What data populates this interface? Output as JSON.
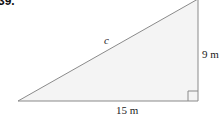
{
  "problem": {
    "number": "39."
  },
  "triangle": {
    "hypotenuse_label": "c",
    "vertical_leg_label": "9 m",
    "horizontal_leg_label": "15 m",
    "right_angle": "bottom-right",
    "fill_color": "#f4f4f4",
    "stroke_color": "#8a8a8a"
  }
}
